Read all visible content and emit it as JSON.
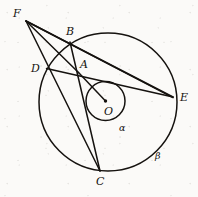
{
  "figure": {
    "kind": "euclidean-geometry-diagram",
    "background_color": "#fbfaf8",
    "ink_color": "#15120f",
    "canvas": {
      "width": 198,
      "height": 197
    }
  },
  "circles": [
    {
      "id": "alpha",
      "label": "α",
      "role": "inner-circle",
      "cx": 105.5,
      "cy": 101.0,
      "r": 19.5,
      "stroke_width": 1.5,
      "label_x": 119,
      "label_y": 131
    },
    {
      "id": "beta",
      "label": "β",
      "role": "outer-circle",
      "cx": 108.0,
      "cy": 102.0,
      "r": 69.0,
      "stroke_width": 1.5,
      "label_x": 155,
      "label_y": 159
    }
  ],
  "center_dot": {
    "id": "O-dot",
    "cx": 105.5,
    "cy": 101.0,
    "r": 1.7
  },
  "points": [
    {
      "id": "F",
      "label": "F",
      "x": 26.0,
      "y": 21.0,
      "label_x": 13,
      "label_y": 17,
      "on": "exterior"
    },
    {
      "id": "B",
      "label": "B",
      "x": 70.0,
      "y": 42.0,
      "label_x": 66,
      "label_y": 35,
      "on": "beta"
    },
    {
      "id": "D",
      "label": "D",
      "x": 46.5,
      "y": 68.5,
      "label_x": 31,
      "label_y": 72,
      "on": "beta"
    },
    {
      "id": "A",
      "label": "A",
      "x": 78.5,
      "y": 72.5,
      "label_x": 80,
      "label_y": 68,
      "on": "interior"
    },
    {
      "id": "E",
      "label": "E",
      "x": 173.0,
      "y": 97.0,
      "label_x": 180,
      "label_y": 101,
      "on": "beta"
    },
    {
      "id": "C",
      "label": "C",
      "x": 100.0,
      "y": 171.0,
      "label_x": 96,
      "label_y": 185,
      "on": "beta"
    },
    {
      "id": "O",
      "label": "O",
      "x": 105.5,
      "y": 101.0,
      "label_x": 104,
      "label_y": 115,
      "on": "center"
    }
  ],
  "segments": [
    {
      "id": "FE-via-B",
      "from": "F",
      "to": "E",
      "through": "B",
      "stroke_width": 1.5
    },
    {
      "id": "FE-via-A",
      "from": "F",
      "to": "E",
      "through": "A",
      "stroke_width": 1.5
    },
    {
      "id": "FC-via-D",
      "from": "F",
      "to": "C",
      "through": "D",
      "stroke_width": 1.5
    },
    {
      "id": "FA",
      "from": "F",
      "to": "A",
      "through": null,
      "stroke_width": 1.5
    },
    {
      "id": "DE-via-A",
      "from": "D",
      "to": "E",
      "through": "A",
      "stroke_width": 1.5
    },
    {
      "id": "BC-via-A",
      "from": "B",
      "to": "C",
      "through": "A",
      "stroke_width": 1.5
    },
    {
      "id": "OA",
      "from": "O",
      "to": "A",
      "through": null,
      "stroke_width": 1.5
    }
  ],
  "labels": {
    "point_labels": [
      "F",
      "B",
      "D",
      "A",
      "E",
      "C",
      "O"
    ],
    "circle_labels": [
      "α",
      "β"
    ]
  }
}
